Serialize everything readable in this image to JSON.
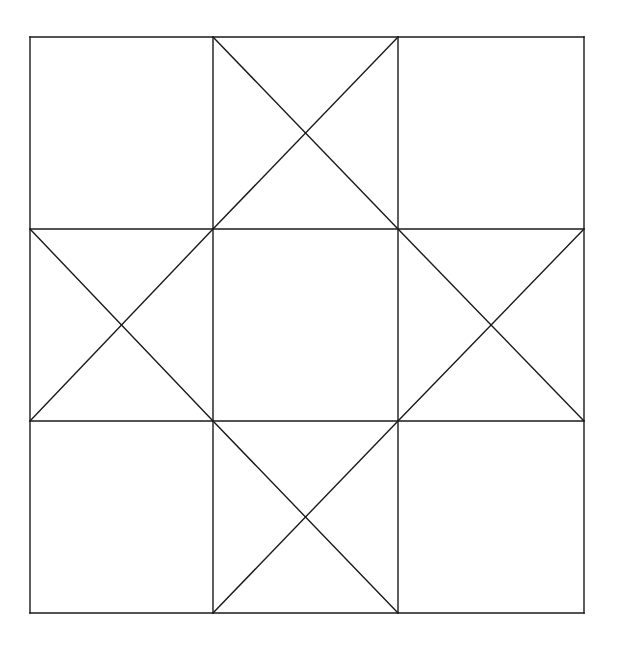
{
  "diagram": {
    "stroke_color": "#1a1a1a",
    "background": "#ffffff",
    "stroke_width": 1.4,
    "grid": {
      "x": [
        30,
        213,
        398,
        584
      ],
      "y": [
        37,
        229,
        421,
        613
      ]
    },
    "cells_with_diagonals": [
      {
        "row": 0,
        "col": 1
      },
      {
        "row": 1,
        "col": 0
      },
      {
        "row": 1,
        "col": 2
      },
      {
        "row": 2,
        "col": 1
      }
    ]
  }
}
